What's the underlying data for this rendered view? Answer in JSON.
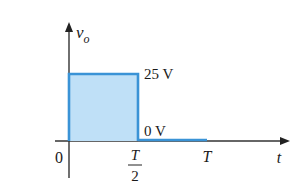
{
  "chart_data": {
    "type": "line",
    "title": "",
    "ylabel": "v",
    "ylabel_subscript": "o",
    "xlabel": "t",
    "x_ticks": [
      {
        "value": 0,
        "label": "0"
      },
      {
        "value": 0.5,
        "label_num": "T",
        "label_den": "2"
      },
      {
        "value": 1,
        "label": "T"
      }
    ],
    "series": [
      {
        "name": "v_o",
        "segments": [
          {
            "x": [
              0,
              0.5
            ],
            "y": 25
          },
          {
            "x": [
              0.5,
              1
            ],
            "y": 0
          }
        ]
      }
    ],
    "annotations": [
      {
        "text": "25 V",
        "at": "high level"
      },
      {
        "text": "0 V",
        "at": "low level"
      }
    ],
    "xlim": [
      0,
      1.4
    ],
    "ylim": [
      0,
      40
    ],
    "colors": {
      "pulse_fill": "#bfe0f7",
      "pulse_stroke": "#3a93d6",
      "axis": "#333333"
    }
  }
}
